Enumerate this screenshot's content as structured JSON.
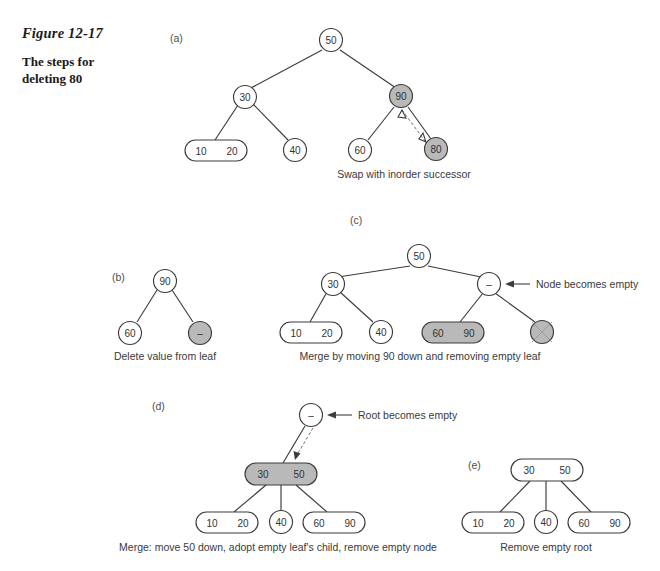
{
  "figure": {
    "label": "Figure 12-17",
    "title_line1": "The steps for",
    "title_line2": "deleting 80"
  },
  "colors": {
    "shaded_fill": "#b9b9b9",
    "node_fill": "#ffffff",
    "stroke": "#3c3c3c",
    "text": "#333333",
    "dashed_arrow": "#6f6f6f"
  },
  "panels": [
    {
      "letter": "(a)",
      "caption": "Swap with inorder successor",
      "nodes": [
        {
          "name": "root-50",
          "values": [
            "50"
          ],
          "shaded": false
        },
        {
          "name": "node-30",
          "values": [
            "30"
          ],
          "shaded": false
        },
        {
          "name": "node-90",
          "values": [
            "90"
          ],
          "shaded": true
        },
        {
          "name": "leaf-10-20",
          "values": [
            "10",
            "20"
          ],
          "shaded": false
        },
        {
          "name": "leaf-40",
          "values": [
            "40"
          ],
          "shaded": false
        },
        {
          "name": "leaf-60",
          "values": [
            "60"
          ],
          "shaded": false
        },
        {
          "name": "leaf-80",
          "values": [
            "80"
          ],
          "shaded": true
        }
      ],
      "annotation": ""
    },
    {
      "letter": "(b)",
      "caption": "Delete value from leaf",
      "nodes": [
        {
          "name": "root-90",
          "values": [
            "90"
          ],
          "shaded": false
        },
        {
          "name": "leaf-60",
          "values": [
            "60"
          ],
          "shaded": false
        },
        {
          "name": "leaf-empty",
          "values": [
            "–"
          ],
          "shaded": true
        }
      ],
      "annotation": ""
    },
    {
      "letter": "(c)",
      "caption": "Merge by moving 90 down and removing empty leaf",
      "nodes": [
        {
          "name": "root-50",
          "values": [
            "50"
          ],
          "shaded": false
        },
        {
          "name": "node-30",
          "values": [
            "30"
          ],
          "shaded": false
        },
        {
          "name": "node-empty",
          "values": [
            "–"
          ],
          "shaded": false
        },
        {
          "name": "leaf-10-20",
          "values": [
            "10",
            "20"
          ],
          "shaded": false
        },
        {
          "name": "leaf-40",
          "values": [
            "40"
          ],
          "shaded": false
        },
        {
          "name": "leaf-60-90",
          "values": [
            "60",
            "90"
          ],
          "shaded": true
        },
        {
          "name": "leaf-removed",
          "values": [
            ""
          ],
          "shaded": true
        }
      ],
      "annotation": "Node becomes empty"
    },
    {
      "letter": "(d)",
      "caption": "Merge: move 50 down, adopt empty leaf's child, remove empty node",
      "nodes": [
        {
          "name": "root-empty",
          "values": [
            "–"
          ],
          "shaded": false
        },
        {
          "name": "node-30-50",
          "values": [
            "30",
            "50"
          ],
          "shaded": true
        },
        {
          "name": "leaf-10-20",
          "values": [
            "10",
            "20"
          ],
          "shaded": false
        },
        {
          "name": "leaf-40",
          "values": [
            "40"
          ],
          "shaded": false
        },
        {
          "name": "leaf-60-90",
          "values": [
            "60",
            "90"
          ],
          "shaded": false
        }
      ],
      "annotation": "Root becomes empty"
    },
    {
      "letter": "(e)",
      "caption": "Remove empty root",
      "nodes": [
        {
          "name": "root-30-50",
          "values": [
            "30",
            "50"
          ],
          "shaded": false
        },
        {
          "name": "leaf-10-20",
          "values": [
            "10",
            "20"
          ],
          "shaded": false
        },
        {
          "name": "leaf-40",
          "values": [
            "40"
          ],
          "shaded": false
        },
        {
          "name": "leaf-60-90",
          "values": [
            "60",
            "90"
          ],
          "shaded": false
        }
      ],
      "annotation": ""
    }
  ]
}
